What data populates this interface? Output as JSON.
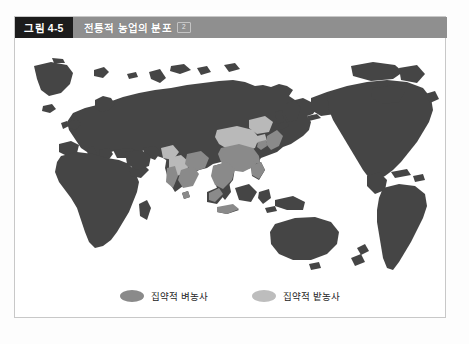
{
  "figure": {
    "number_label": "그림 4-5",
    "title": "전통적 농업의 분포",
    "title_badge": "2"
  },
  "map": {
    "projection_note": "Pacific-centered world map",
    "ocean_color": "#ffffff",
    "land_color": "#454545",
    "intensive_rice_color": "#8a8a8a",
    "intensive_dry_field_color": "#b9b9b9",
    "regions": [
      {
        "name": "eurasia-africa-landmass",
        "category": "land"
      },
      {
        "name": "americas-landmass",
        "category": "land"
      },
      {
        "name": "australia-landmass",
        "category": "land"
      },
      {
        "name": "south-china-rice",
        "category": "intensive-rice"
      },
      {
        "name": "southeast-asia-rice",
        "category": "intensive-rice"
      },
      {
        "name": "india-ganges-rice",
        "category": "intensive-rice"
      },
      {
        "name": "japan-korea-rice",
        "category": "intensive-rice"
      },
      {
        "name": "north-china-dry-field",
        "category": "intensive-dry-field"
      },
      {
        "name": "india-deccan-dry-field",
        "category": "intensive-dry-field"
      }
    ]
  },
  "legend": {
    "items": [
      {
        "label": "집약적 벼농사",
        "color": "#8a8a8a",
        "swatch_name": "rice-swatch"
      },
      {
        "label": "집약적 밭농사",
        "color": "#bdbdbd",
        "swatch_name": "dry-field-swatch"
      }
    ]
  },
  "colors": {
    "header_bar": "#8f8f8f",
    "number_box": "#1c1c1c",
    "panel_border": "#c8c8c8",
    "page_background": "#fdfdfd"
  }
}
